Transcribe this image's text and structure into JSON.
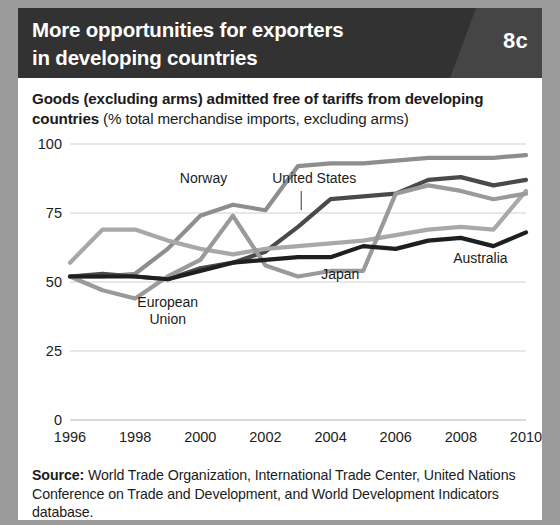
{
  "header": {
    "title_line1": "More opportunities for exporters",
    "title_line2": "in developing countries",
    "badge": "8c",
    "bg_color": "#333232",
    "badge_bg_color": "#464545"
  },
  "subtitle": {
    "bold_part": "Goods (excluding arms) admitted free of tariffs from developing countries",
    "normal_part": " (% total merchandise imports, excluding arms)"
  },
  "source": {
    "label": "Source:",
    "text": " World Trade Organization, International Trade Center, United Nations Conference on Trade and Development, and World Development Indicators database."
  },
  "chart_data": {
    "type": "line",
    "title": "Goods (excluding arms) admitted free of tariffs from developing countries",
    "subtitle": "% total merchandise imports, excluding arms",
    "xlabel": "",
    "ylabel": "% total merchandise imports, excluding arms",
    "xlim": [
      1996,
      2010
    ],
    "ylim": [
      0,
      100
    ],
    "yticks": [
      0,
      25,
      50,
      75,
      100
    ],
    "xticks": [
      1996,
      1998,
      2000,
      2002,
      2004,
      2006,
      2008,
      2010
    ],
    "x": [
      1996,
      1997,
      1998,
      1999,
      2000,
      2001,
      2002,
      2003,
      2004,
      2005,
      2006,
      2007,
      2008,
      2009,
      2010
    ],
    "grid": true,
    "legend_position": "inline-annotations",
    "series": [
      {
        "name": "Norway",
        "color": "#8e8e8e",
        "width": 4.2,
        "values": [
          52,
          52,
          53,
          62,
          74,
          78,
          76,
          92,
          93,
          93,
          94,
          95,
          95,
          95,
          96
        ],
        "label_x": 2000.1,
        "label_y": 86,
        "label_anchor": "middle"
      },
      {
        "name": "United States",
        "color": "#4a4a4a",
        "width": 4.2,
        "values": [
          52,
          53,
          52,
          51,
          55,
          57,
          61,
          70,
          80,
          81,
          82,
          87,
          88,
          85,
          87
        ],
        "label_x": 2003.5,
        "label_y": 86,
        "label_anchor": "middle",
        "leader": {
          "x": 2003.1,
          "y_top": 83,
          "y_bottom": 76
        }
      },
      {
        "name": "European Union",
        "color": "#a8a8a8",
        "width": 4.2,
        "values": [
          57,
          69,
          69,
          65,
          62,
          60,
          62,
          63,
          64,
          65,
          67,
          69,
          70,
          69,
          83
        ],
        "label_line1": "European",
        "label_line2": "Union",
        "label_x": 1999.0,
        "label_y": 41,
        "label_anchor": "middle"
      },
      {
        "name": "Japan",
        "color": "#9a9a9a",
        "width": 4.2,
        "values": [
          52,
          47,
          44,
          52,
          58,
          74,
          56,
          52,
          54,
          54,
          82,
          85,
          83,
          80,
          82
        ],
        "label_x": 2004.3,
        "label_y": 51,
        "label_anchor": "middle"
      },
      {
        "name": "Australia",
        "color": "#1f1f1f",
        "width": 4.2,
        "values": [
          52,
          52,
          52,
          51,
          54,
          57,
          58,
          59,
          59,
          63,
          62,
          65,
          66,
          63,
          68
        ],
        "label_x": 2008.6,
        "label_y": 57,
        "label_anchor": "middle"
      }
    ]
  }
}
